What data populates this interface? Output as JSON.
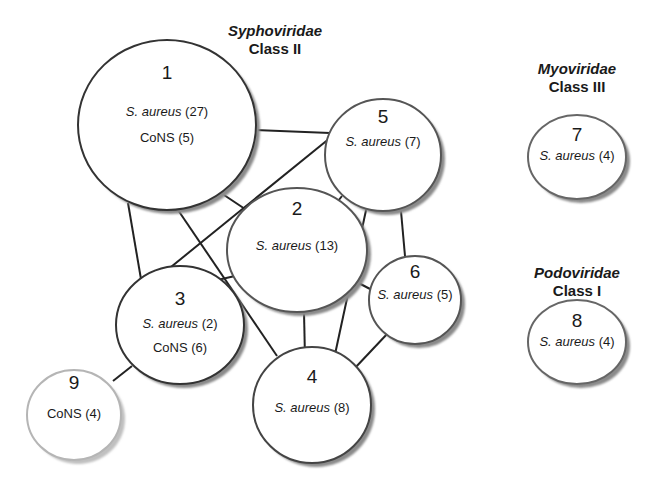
{
  "groups": [
    {
      "family": "Syphoviridae",
      "class": "Class II"
    },
    {
      "family": "Myoviridae",
      "class": "Class III"
    },
    {
      "family": "Podoviridae",
      "class": "Class I"
    }
  ],
  "nodes": [
    {
      "id": "1",
      "lines": [
        {
          "species": "S. aureus",
          "count": "(27)"
        },
        {
          "species": "CoNS",
          "count": "(5)"
        }
      ]
    },
    {
      "id": "2",
      "lines": [
        {
          "species": "S. aureus",
          "count": "(13)"
        }
      ]
    },
    {
      "id": "3",
      "lines": [
        {
          "species": "S. aureus",
          "count": "(2)"
        },
        {
          "species": "CoNS",
          "count": "(6)"
        }
      ]
    },
    {
      "id": "4",
      "lines": [
        {
          "species": "S. aureus",
          "count": "(8)"
        }
      ]
    },
    {
      "id": "5",
      "lines": [
        {
          "species": "S. aureus",
          "count": "(7)"
        }
      ]
    },
    {
      "id": "6",
      "lines": [
        {
          "species": "S. aureus",
          "count": "(5)"
        }
      ]
    },
    {
      "id": "7",
      "lines": [
        {
          "species": "S. aureus",
          "count": "(4)"
        }
      ]
    },
    {
      "id": "8",
      "lines": [
        {
          "species": "S. aureus",
          "count": "(4)"
        }
      ]
    },
    {
      "id": "9",
      "lines": [
        {
          "species": "CoNS",
          "count": "(4)"
        }
      ]
    }
  ],
  "edges": [
    [
      "1",
      "5"
    ],
    [
      "1",
      "3"
    ],
    [
      "1",
      "2"
    ],
    [
      "1",
      "4"
    ],
    [
      "3",
      "5"
    ],
    [
      "3",
      "2"
    ],
    [
      "3",
      "9"
    ],
    [
      "5",
      "2"
    ],
    [
      "5",
      "4"
    ],
    [
      "5",
      "6"
    ],
    [
      "2",
      "4"
    ],
    [
      "2",
      "6"
    ],
    [
      "6",
      "4"
    ]
  ],
  "colors": {
    "node_border": "#333333",
    "node_border_light": "#b5b5b5",
    "shadow": "#8a8a8a",
    "edge": "#222222"
  }
}
